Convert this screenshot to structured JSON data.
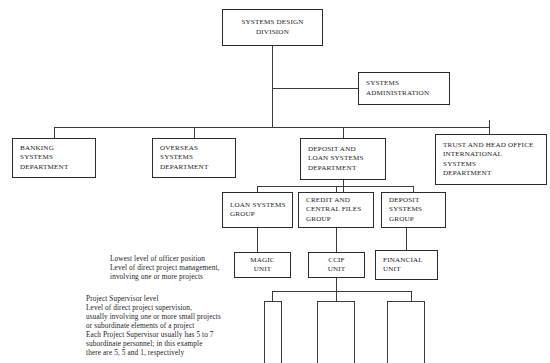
{
  "chart": {
    "type": "org-chart",
    "nodes": {
      "division": {
        "label": "SYSTEMS DESIGN\nDIVISION"
      },
      "administration": {
        "label": "SYSTEMS\nADMINISTRATION"
      },
      "banking": {
        "label": "BANKING\nSYSTEMS\nDEPARTMENT"
      },
      "overseas": {
        "label": "OVERSEAS\nSYSTEMS\nDEPARTMENT"
      },
      "deposit_loan": {
        "label": "DEPOSIT AND\nLOAN SYSTEMS\nDEPARTMENT"
      },
      "trust": {
        "label": "TRUST AND HEAD OFFICE\nINTERNATIONAL\nSYSTEMS\nDEPARTMENT"
      },
      "loan_group": {
        "label": "LOAN SYSTEMS\nGROUP"
      },
      "credit_group": {
        "label": "CREDIT AND\nCENTRAL FILES\nGROUP"
      },
      "deposit_group": {
        "label": "DEPOSIT\nSYSTEMS\nGROUP"
      },
      "magic_unit": {
        "label": "MAGIC\nUNIT"
      },
      "ccif_unit": {
        "label": "CCIF\nUNIT"
      },
      "financial_unit": {
        "label": "FINANCIAL\nUNIT"
      }
    },
    "annotations": {
      "officer_level": "Lowest level of officer position\nLevel of direct project management,\ninvolving one or more projects",
      "supervisor_level": "Project Supervisor level\nLevel of direct project supervision,\nusually involving one or more small projects\nor subordinate elements of a project\nEach Project Supervisor usually has 5 to 7\nsubordinate personnel; in this example\nthere are 5, 5 and 1, respectively"
    }
  }
}
